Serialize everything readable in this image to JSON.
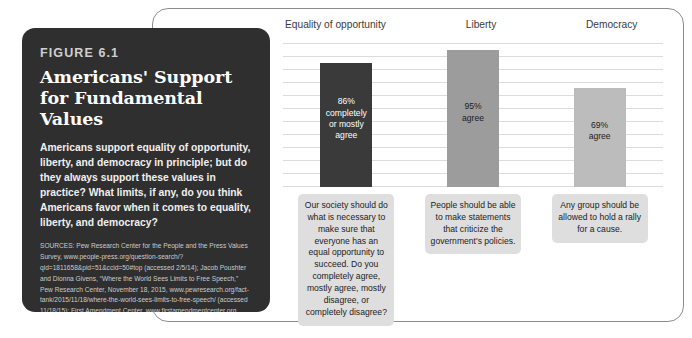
{
  "figure": {
    "kicker": "FIGURE 6.1",
    "title": "Americans' Support for Fundamental Values",
    "description": "Americans support equality of opportunity, liberty, and democracy in principle; but do they always support these values in practice? What limits, if any, do you think Americans favor when it comes to equality, liberty, and democracy?",
    "sources": "SOURCES: Pew Research Center for the People and the Press Values Survey, www.people-press.org/question-search/?qid=1811658&pid=51&ccid=50#top (accessed 2/5/14); Jacob Poushter and Dionna Givens, “Where the World Sees Limits to Free Speech,” Pew Research Center, November 18, 2015, www.pewresearch.org/fact-tank/2015/11/18/where-the-world-sees-limits-to-free-speech/ (accessed 11/18/15); First Amendment Center, www.firstamendmentcenter.org (accessed 11/18/15)."
  },
  "chart_data": {
    "type": "bar",
    "title": "Americans' Support for Fundamental Values",
    "xlabel": "",
    "ylabel": "",
    "ylim": [
      0,
      100
    ],
    "grid": true,
    "gridline_count": 12,
    "legend": "none",
    "categories": [
      "Equality of opportunity",
      "Liberty",
      "Democracy"
    ],
    "values": [
      86,
      95,
      69
    ],
    "bar_labels": [
      "86%\ncompletely\nor mostly\nagree",
      "95%\nagree",
      "69%\nagree"
    ],
    "bar_colors": [
      "#3a3a3a",
      "#9c9c9c",
      "#bcbcbc"
    ],
    "annotations": [
      "Our society should do what is necessary to make sure that everyone has an equal opportunity to succeed. Do you completely agree, mostly agree, mostly disagree, or completely disagree?",
      "People should be able to make statements that criticize the government's policies.",
      "Any group should be allowed to hold a rally for a cause."
    ]
  },
  "columns": [
    {
      "header": "Equality of opportunity",
      "value": 86,
      "bar_label": "86% completely or mostly agree",
      "bar_label_lines": [
        "86%",
        "completely",
        "or mostly",
        "agree"
      ],
      "bar_color": "#3a3a3a",
      "question": "Our society should do what is necessary to make sure that everyone has an equal opportunity to succeed. Do you completely agree, mostly agree, mostly disagree, or completely disagree?"
    },
    {
      "header": "Liberty",
      "value": 95,
      "bar_label": "95% agree",
      "bar_label_lines": [
        "95%",
        "agree"
      ],
      "bar_color": "#9c9c9c",
      "question": "People should be able to make statements that criticize the government's policies."
    },
    {
      "header": "Democracy",
      "value": 69,
      "bar_label": "69% agree",
      "bar_label_lines": [
        "69%",
        "agree"
      ],
      "bar_color": "#bcbcbc",
      "question": "Any group should be allowed to hold a rally for a cause."
    }
  ],
  "colors": {
    "card_background": "#2f2f2f",
    "grid": "#dcdcdc",
    "frame": "#8d8d8d",
    "caption_background": "#dedede"
  }
}
